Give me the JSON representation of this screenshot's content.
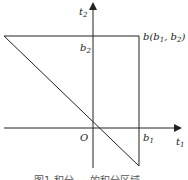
{
  "diagram": {
    "axes": {
      "x_label": "t",
      "x_label_sub": "1",
      "y_label": "t",
      "y_label_sub": "2",
      "origin_label": "O"
    },
    "ticks": {
      "b1": "b",
      "b1_sub": "1",
      "b2": "b",
      "b2_sub": "2"
    },
    "point": {
      "name": "b",
      "coords": "(b",
      "c1_sub": "1",
      "sep": ", b",
      "c2_sub": "2",
      "close": ")"
    },
    "caption": "图1  积分 … 的积分区域",
    "colors": {
      "line": "#222222",
      "background": "#ffffff"
    }
  }
}
